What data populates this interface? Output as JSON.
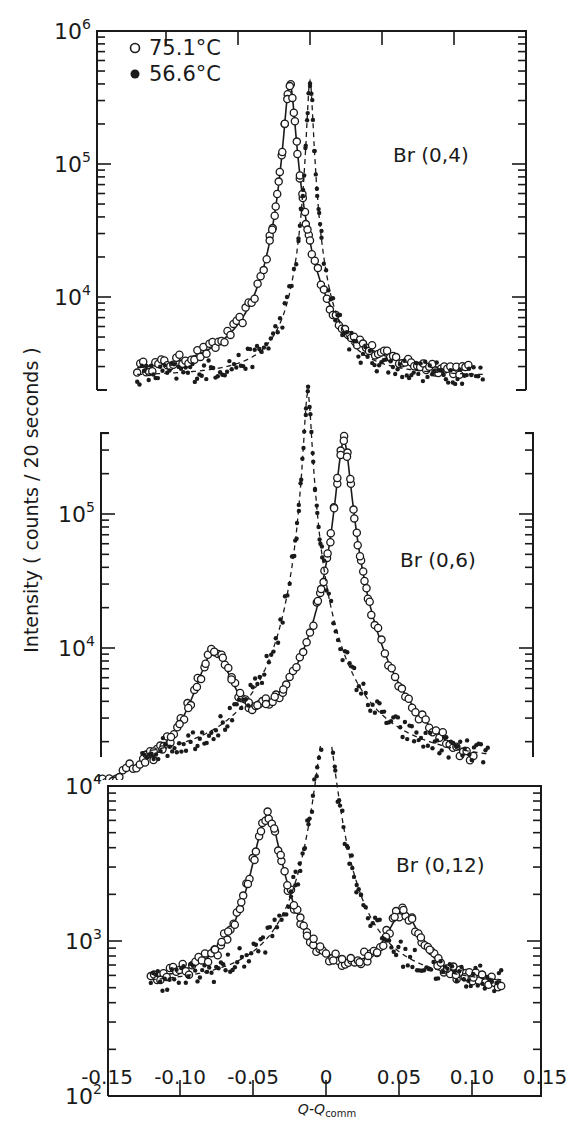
{
  "chart_data": {
    "type": "scatter",
    "title": "",
    "xlabel": "Q-Q",
    "xlabel_sub": "comm",
    "ylabel": "Intensity ( counts / 20 seconds )",
    "x_ticks": [
      "-0.15",
      "-0.10",
      "-0.05",
      "0",
      "0.05",
      "0.10",
      "0.15"
    ],
    "x_tick_values": [
      -0.15,
      -0.1,
      -0.05,
      0,
      0.05,
      0.1,
      0.15
    ],
    "xlim": [
      -0.15,
      0.15
    ],
    "yscale": "log",
    "legend": {
      "position": "upper-left (top panel)",
      "entries": [
        {
          "marker": "open-circle",
          "label": "75.1°C",
          "line": "solid fit"
        },
        {
          "marker": "filled-circle",
          "label": "56.6°C",
          "line": "dashed fit"
        }
      ]
    },
    "panels": [
      {
        "name": "Br(0,4)",
        "label": "Br (0,4)",
        "ylim": [
          2000,
          1000000
        ],
        "y_ticks": [
          {
            "base": "10",
            "exp": "6",
            "value": 1000000
          },
          {
            "base": "10",
            "exp": "5",
            "value": 100000
          },
          {
            "base": "10",
            "exp": "4",
            "value": 10000
          }
        ],
        "series": [
          {
            "name": "75.1°C",
            "marker": "open",
            "baseline": 2500,
            "peaks": [
              {
                "x": -0.014,
                "height": 400000,
                "width": 0.0035
              }
            ],
            "x_range": [
              -0.12,
              0.11
            ]
          },
          {
            "name": "56.6°C",
            "marker": "filled",
            "baseline": 2500,
            "peaks": [
              {
                "x": 0.0,
                "height": 420000,
                "width": 0.002
              }
            ],
            "x_range": [
              -0.12,
              0.12
            ]
          }
        ]
      },
      {
        "name": "Br(0,6)",
        "label": "Br (0,6)",
        "ylim": [
          1500,
          400000
        ],
        "y_ticks": [
          {
            "base": "10",
            "exp": "5",
            "value": 100000
          },
          {
            "base": "10",
            "exp": "4",
            "value": 10000
          }
        ],
        "series": [
          {
            "name": "75.1°C",
            "marker": "open",
            "baseline": 600,
            "peaks": [
              {
                "x": -0.07,
                "height": 8000,
                "width": 0.012
              },
              {
                "x": 0.02,
                "height": 350000,
                "width": 0.0045
              }
            ],
            "x_range": [
              -0.15,
              0.11
            ]
          },
          {
            "name": "56.6°C",
            "marker": "filled",
            "baseline": 1300,
            "peaks": [
              {
                "x": -0.005,
                "height": 800000,
                "width": 0.0025
              }
            ],
            "x_range": [
              -0.12,
              0.12
            ]
          }
        ]
      },
      {
        "name": "Br(0,12)",
        "label": "Br (0,12)",
        "ylim": [
          100,
          10000
        ],
        "y_ticks": [
          {
            "base": "10",
            "exp": "4",
            "value": 10000
          },
          {
            "base": "10",
            "exp": "3",
            "value": 1000
          },
          {
            "base": "10",
            "exp": "2",
            "value": 100
          }
        ],
        "series": [
          {
            "name": "75.1°C",
            "marker": "open",
            "baseline": 500,
            "peaks": [
              {
                "x": -0.04,
                "height": 6000,
                "width": 0.009
              },
              {
                "x": 0.053,
                "height": 1000,
                "width": 0.012
              }
            ],
            "x_range": [
              -0.12,
              0.12
            ]
          },
          {
            "name": "56.6°C",
            "marker": "filled",
            "baseline": 500,
            "peaks": [
              {
                "x": 0.0,
                "height": 25000,
                "width": 0.006
              }
            ],
            "x_range": [
              -0.12,
              0.12
            ]
          }
        ]
      }
    ]
  }
}
